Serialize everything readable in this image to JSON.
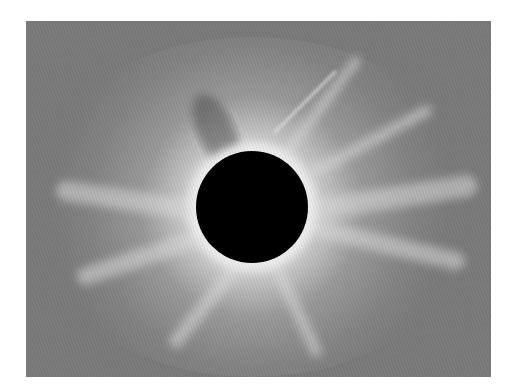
{
  "image": {
    "subject": "total solar eclipse corona",
    "colors": {
      "background": "#ffffff",
      "sky": "#7b7b7b",
      "corona_bright": "#e8e8e8",
      "moon_disk": "#000000"
    }
  }
}
